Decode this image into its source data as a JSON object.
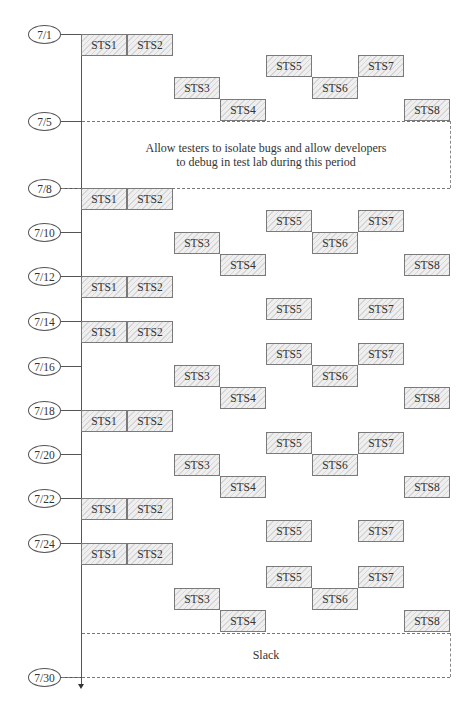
{
  "diagram": {
    "type": "test-schedule-timeline",
    "dates": [
      {
        "label": "7/1",
        "y": 34
      },
      {
        "label": "7/5",
        "y": 121
      },
      {
        "label": "7/8",
        "y": 188
      },
      {
        "label": "7/10",
        "y": 232
      },
      {
        "label": "7/12",
        "y": 276
      },
      {
        "label": "7/14",
        "y": 321
      },
      {
        "label": "7/16",
        "y": 366
      },
      {
        "label": "7/18",
        "y": 410
      },
      {
        "label": "7/20",
        "y": 454
      },
      {
        "label": "7/22",
        "y": 498
      },
      {
        "label": "7/24",
        "y": 543
      },
      {
        "label": "7/30",
        "y": 677
      }
    ],
    "blocks": [
      {
        "label": "STS1",
        "x": 81,
        "y": 34
      },
      {
        "label": "STS2",
        "x": 127,
        "y": 34
      },
      {
        "label": "STS5",
        "x": 266,
        "y": 55
      },
      {
        "label": "STS7",
        "x": 358,
        "y": 55
      },
      {
        "label": "STS3",
        "x": 174,
        "y": 77
      },
      {
        "label": "STS6",
        "x": 312,
        "y": 77
      },
      {
        "label": "STS4",
        "x": 220,
        "y": 99
      },
      {
        "label": "STS8",
        "x": 404,
        "y": 99
      },
      {
        "label": "STS1",
        "x": 81,
        "y": 188
      },
      {
        "label": "STS2",
        "x": 127,
        "y": 188
      },
      {
        "label": "STS5",
        "x": 266,
        "y": 210
      },
      {
        "label": "STS7",
        "x": 358,
        "y": 210
      },
      {
        "label": "STS3",
        "x": 174,
        "y": 232
      },
      {
        "label": "STS6",
        "x": 312,
        "y": 232
      },
      {
        "label": "STS4",
        "x": 220,
        "y": 254
      },
      {
        "label": "STS8",
        "x": 404,
        "y": 254
      },
      {
        "label": "STS1",
        "x": 81,
        "y": 276
      },
      {
        "label": "STS2",
        "x": 127,
        "y": 276
      },
      {
        "label": "STS5",
        "x": 266,
        "y": 298
      },
      {
        "label": "STS7",
        "x": 358,
        "y": 298
      },
      {
        "label": "STS1",
        "x": 81,
        "y": 321
      },
      {
        "label": "STS2",
        "x": 127,
        "y": 321
      },
      {
        "label": "STS5",
        "x": 266,
        "y": 343
      },
      {
        "label": "STS7",
        "x": 358,
        "y": 343
      },
      {
        "label": "STS3",
        "x": 174,
        "y": 365
      },
      {
        "label": "STS6",
        "x": 312,
        "y": 365
      },
      {
        "label": "STS4",
        "x": 220,
        "y": 387
      },
      {
        "label": "STS8",
        "x": 404,
        "y": 387
      },
      {
        "label": "STS1",
        "x": 81,
        "y": 410
      },
      {
        "label": "STS2",
        "x": 127,
        "y": 410
      },
      {
        "label": "STS5",
        "x": 266,
        "y": 432
      },
      {
        "label": "STS7",
        "x": 358,
        "y": 432
      },
      {
        "label": "STS3",
        "x": 174,
        "y": 454
      },
      {
        "label": "STS6",
        "x": 312,
        "y": 454
      },
      {
        "label": "STS4",
        "x": 220,
        "y": 476
      },
      {
        "label": "STS8",
        "x": 404,
        "y": 476
      },
      {
        "label": "STS1",
        "x": 81,
        "y": 498
      },
      {
        "label": "STS2",
        "x": 127,
        "y": 498
      },
      {
        "label": "STS5",
        "x": 266,
        "y": 520
      },
      {
        "label": "STS7",
        "x": 358,
        "y": 520
      },
      {
        "label": "STS1",
        "x": 81,
        "y": 543
      },
      {
        "label": "STS2",
        "x": 127,
        "y": 543
      },
      {
        "label": "STS5",
        "x": 266,
        "y": 566
      },
      {
        "label": "STS7",
        "x": 358,
        "y": 566
      },
      {
        "label": "STS3",
        "x": 174,
        "y": 588
      },
      {
        "label": "STS6",
        "x": 312,
        "y": 588
      },
      {
        "label": "STS4",
        "x": 220,
        "y": 610
      },
      {
        "label": "STS8",
        "x": 404,
        "y": 610
      }
    ],
    "periods": [
      {
        "name": "debug-period",
        "top": 121,
        "bottom": 188,
        "lines": [
          "Allow testers to isolate bugs and allow developers",
          "to debug in test lab during this period"
        ]
      },
      {
        "name": "slack-period",
        "top": 633,
        "bottom": 677,
        "lines": [
          "Slack"
        ]
      }
    ]
  }
}
